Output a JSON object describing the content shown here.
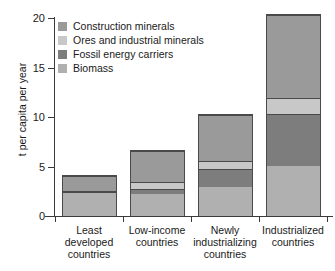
{
  "chart_data": {
    "type": "bar",
    "title": "",
    "subtitle": "",
    "stacked": true,
    "xlabel": "",
    "ylabel": "t per capita per year",
    "ylim": [
      0,
      20
    ],
    "yticks": [
      0,
      5,
      10,
      15,
      20
    ],
    "ytick_labels": [
      "0",
      "5",
      "10",
      "15",
      "20"
    ],
    "grid": false,
    "legend_position": "top-left",
    "categories": [
      "Least developed countries",
      "Low-income countries",
      "Newly industrializing countries",
      "Industrialized countries"
    ],
    "category_lines": [
      [
        "Least",
        "developed",
        "countries"
      ],
      [
        "Low-income",
        "countries"
      ],
      [
        "Newly",
        "industrializing",
        "countries"
      ],
      [
        "Industrialized",
        "countries"
      ]
    ],
    "series": [
      {
        "name": "Biomass",
        "color": "#b0b0b0",
        "values": [
          2.4,
          2.3,
          3.0,
          5.1
        ]
      },
      {
        "name": "Fossil energy carriers",
        "color": "#7d7d7d",
        "values": [
          0.15,
          0.5,
          1.8,
          5.3
        ]
      },
      {
        "name": "Ores and industrial minerals",
        "color": "#c8c8c8",
        "values": [
          0.05,
          0.7,
          0.8,
          1.6
        ]
      },
      {
        "name": "Construction minerals",
        "color": "#9a9a9a",
        "values": [
          1.5,
          3.2,
          4.7,
          8.4
        ]
      }
    ],
    "totals": [
      4.1,
      6.7,
      10.3,
      20.4
    ],
    "stack_order_bottom_to_top": [
      "Biomass",
      "Fossil energy carriers",
      "Ores and industrial minerals",
      "Construction minerals"
    ]
  },
  "legend": {
    "entries": [
      {
        "label": "Construction minerals",
        "color": "#9a9a9a"
      },
      {
        "label": "Ores and industrial minerals",
        "color": "#c8c8c8"
      },
      {
        "label": "Fossil energy carriers",
        "color": "#7d7d7d"
      },
      {
        "label": "Biomass",
        "color": "#b0b0b0"
      }
    ]
  },
  "axes": {
    "y_title": "t per capita per year",
    "y_tick_labels": [
      "20",
      "15",
      "10",
      "5",
      "0"
    ]
  },
  "colors": {
    "axis": "#3a3a3a",
    "bar_outline": "#4a4a4a",
    "background": "#ffffff",
    "text": "#1a1a1a"
  }
}
